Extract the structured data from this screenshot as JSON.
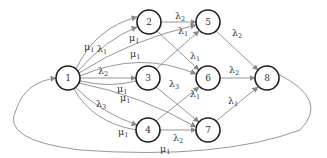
{
  "diagram": {
    "type": "directed-network",
    "colors": {
      "node_stroke": "#1e1e1e",
      "edge": "#8a8a8a",
      "text": "#333333",
      "background": "#ffffff"
    },
    "nodes": [
      {
        "id": "1",
        "label": "1",
        "x": 68,
        "y": 78
      },
      {
        "id": "2",
        "label": "2",
        "x": 149,
        "y": 22
      },
      {
        "id": "3",
        "label": "3",
        "x": 148,
        "y": 78
      },
      {
        "id": "4",
        "label": "4",
        "x": 148,
        "y": 130
      },
      {
        "id": "5",
        "label": "5",
        "x": 208,
        "y": 22
      },
      {
        "id": "6",
        "label": "6",
        "x": 208,
        "y": 78
      },
      {
        "id": "7",
        "label": "7",
        "x": 208,
        "y": 130
      },
      {
        "id": "8",
        "label": "8",
        "x": 267,
        "y": 78
      }
    ],
    "edge_labels": [
      {
        "text": "μ",
        "sub": "1",
        "x": 87,
        "y": 47,
        "edge": "1→2 (outer)"
      },
      {
        "text": "λ",
        "sub": "1",
        "x": 99,
        "y": 50,
        "edge": "1→2 (inner)"
      },
      {
        "text": "μ",
        "sub": "1",
        "x": 130,
        "y": 40,
        "edge": "1→5"
      },
      {
        "text": "μ",
        "sub": "1",
        "x": 132,
        "y": 55,
        "edge": "1→6"
      },
      {
        "text": "λ",
        "sub": "2",
        "x": 100,
        "y": 72,
        "edge": "1→3"
      },
      {
        "text": "μ",
        "sub": "1",
        "x": 118,
        "y": 90,
        "edge": "1→7 (upper)"
      },
      {
        "text": "μ",
        "sub": "1",
        "x": 123,
        "y": 100,
        "edge": "1→7"
      },
      {
        "text": "λ",
        "sub": "3",
        "x": 97,
        "y": 104,
        "edge": "1→4"
      },
      {
        "text": "μ",
        "sub": "1",
        "x": 120,
        "y": 133,
        "edge": "1→4 (lower)"
      },
      {
        "text": "λ",
        "sub": "2",
        "x": 173,
        "y": 17,
        "edge": "2→5"
      },
      {
        "text": "λ",
        "sub": "1",
        "x": 178,
        "y": 33,
        "edge": "3→5"
      },
      {
        "text": "λ",
        "sub": "1",
        "x": 190,
        "y": 59,
        "edge": "2→6"
      },
      {
        "text": "λ",
        "sub": "3",
        "x": 171,
        "y": 86,
        "edge": "3→7"
      },
      {
        "text": "λ",
        "sub": "1",
        "x": 192,
        "y": 96,
        "edge": "4→6"
      },
      {
        "text": "λ",
        "sub": "2",
        "x": 174,
        "y": 142,
        "edge": "4→7"
      },
      {
        "text": "λ",
        "sub": "2",
        "x": 230,
        "y": 35,
        "edge": "5→8"
      },
      {
        "text": "λ",
        "sub": "2",
        "x": 230,
        "y": 72,
        "edge": "6→8"
      },
      {
        "text": "λ",
        "sub": "1",
        "x": 228,
        "y": 102,
        "edge": "7→8"
      },
      {
        "text": "μ",
        "sub": "1",
        "x": 160,
        "y": 150,
        "edge": "8→1 (return)"
      }
    ]
  }
}
